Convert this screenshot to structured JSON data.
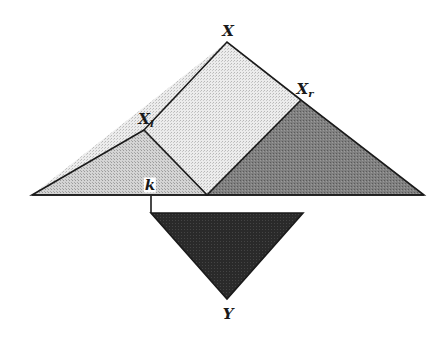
{
  "diagram": {
    "labels": {
      "top": "X",
      "left_main": "X",
      "left_sub": "l",
      "right_main": "X",
      "right_sub": "r",
      "split": "k",
      "bottom": "Y"
    },
    "colors": {
      "outer_triangle_fill": "#e2e2e2",
      "left_subtree_fill": "#cfcfcf",
      "right_subtree_fill": "#7a7a7a",
      "result_triangle_fill": "#262626",
      "stroke": "#1a1a1a"
    }
  }
}
